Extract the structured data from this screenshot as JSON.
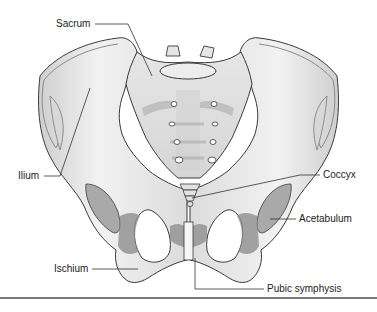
{
  "figure": {
    "labels": {
      "sacrum": "Sacrum",
      "ilium": "Ilium",
      "coccyx": "Coccyx",
      "acetabulum": "Acetabulum",
      "ischium": "Ischium",
      "pubic_symphysis": "Pubic symphysis"
    },
    "colors": {
      "bone_light": "#ececec",
      "bone_mid": "#d4d4d4",
      "bone_shadow": "#9a9a9a",
      "outline": "#3a3a3a",
      "leader_line": "#333333",
      "rule": "#7a7a7a"
    }
  }
}
